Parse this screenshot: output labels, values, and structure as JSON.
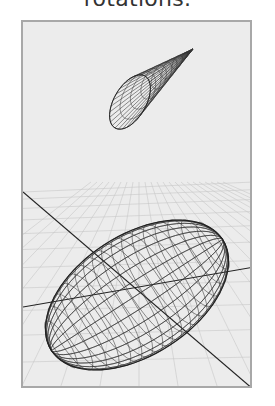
{
  "caption": "rotations.",
  "viewport": {
    "background": "#ececec",
    "border": "#a8a8a8",
    "wire_color": "#333333",
    "grid_color": "#c8c8c8"
  },
  "objects": [
    {
      "name": "cone",
      "type": "wireframe-cone"
    },
    {
      "name": "ellipsoid",
      "type": "wireframe-ellipsoid"
    },
    {
      "name": "axes",
      "type": "coordinate-axes"
    },
    {
      "name": "ground-grid",
      "type": "perspective-grid"
    }
  ]
}
